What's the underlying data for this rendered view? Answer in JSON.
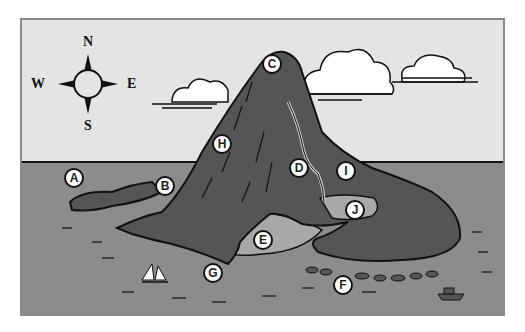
{
  "compass": {
    "north": "N",
    "south": "S",
    "east": "E",
    "west": "W"
  },
  "colors": {
    "sky": "#e4e4e4",
    "sea": "#8c8c8c",
    "land": "#555555",
    "shallows": "#a8a8a8",
    "frame": "#8a8a8a",
    "outline": "#111111",
    "marker_fill": "#ffffff"
  },
  "markers": [
    {
      "label": "A",
      "feature": "western headland"
    },
    {
      "label": "B",
      "feature": "cliff by harbor"
    },
    {
      "label": "C",
      "feature": "volcano summit"
    },
    {
      "label": "D",
      "feature": "river"
    },
    {
      "label": "E",
      "feature": "bay / lagoon"
    },
    {
      "label": "F",
      "feature": "offshore reef"
    },
    {
      "label": "G",
      "feature": "river mouth / pier"
    },
    {
      "label": "H",
      "feature": "mountain slope"
    },
    {
      "label": "I",
      "feature": "eastern slope"
    },
    {
      "label": "J",
      "feature": "delta / marsh"
    }
  ]
}
